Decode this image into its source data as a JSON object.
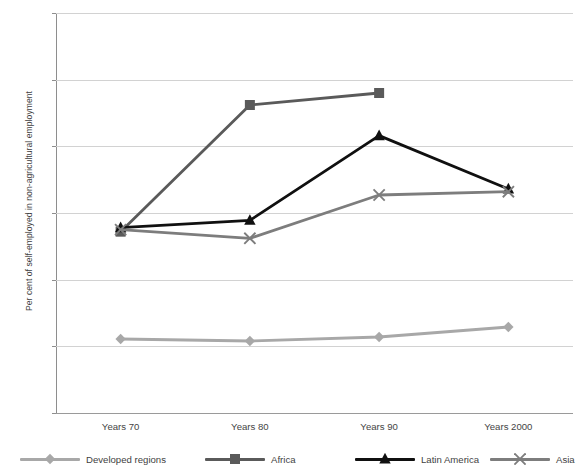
{
  "top_clipped_text": "",
  "chart_data": {
    "type": "line",
    "title": "",
    "xlabel": "",
    "ylabel": "Per cent of self-employed in non-agricultural employment",
    "categories": [
      "Years 70",
      "Years 80",
      "Years 90",
      "Years 2000"
    ],
    "ylim": [
      0,
      60
    ],
    "yticks": [
      0,
      10,
      20,
      30,
      40,
      50,
      60
    ],
    "grid": "horizontal",
    "legend_position": "bottom",
    "series": [
      {
        "name": "Developed regions",
        "color": "#a8a8a8",
        "marker": "diamond",
        "values": [
          11.1,
          10.8,
          11.4,
          12.9
        ]
      },
      {
        "name": "Africa",
        "color": "#5a5a5a",
        "marker": "square",
        "values": [
          27.2,
          46.2,
          48.0,
          null
        ]
      },
      {
        "name": "Latin America",
        "color": "#101010",
        "marker": "triangle",
        "values": [
          27.8,
          28.9,
          41.6,
          33.6
        ]
      },
      {
        "name": "Asia",
        "color": "#7d7d7d",
        "marker": "cross",
        "values": [
          27.5,
          26.2,
          32.7,
          33.2
        ]
      }
    ]
  }
}
